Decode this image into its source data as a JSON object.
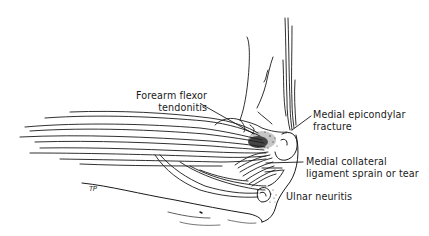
{
  "figure": {
    "labels": [
      {
        "id": "forearm-flexor-tendonitis",
        "lines": [
          "Forearm flexor",
          "tendonitis"
        ]
      },
      {
        "id": "medial-epicondylar-fracture",
        "lines": [
          "Medial epicondylar",
          "fracture"
        ]
      },
      {
        "id": "medial-collateral-ligament",
        "lines": [
          "Medial collateral",
          "ligament sprain or tear"
        ]
      },
      {
        "id": "ulnar-neuritis",
        "lines": [
          "Ulnar neuritis"
        ]
      }
    ],
    "signature": "TP",
    "colors": {
      "line": "#1a1a1a",
      "background": "#ffffff"
    }
  }
}
